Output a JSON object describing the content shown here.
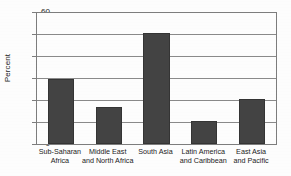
{
  "chart_data": {
    "type": "bar",
    "title": "",
    "xlabel": "",
    "ylabel": "Percent",
    "ylim": [
      0,
      60
    ],
    "ytick_values": [
      0,
      10,
      20,
      30,
      40,
      50,
      60
    ],
    "ytick_labels": [
      "0",
      "10",
      "20",
      "30",
      "40",
      "50",
      "60"
    ],
    "grid": true,
    "legend": "none",
    "categories": [
      "Sub-Saharan\nAfrica",
      "Middle East\nand North Africa",
      "South Asia",
      "Latin America\nand Caribbean",
      "East Asia\nand Pacific"
    ],
    "values": [
      30,
      17,
      51,
      10.5,
      20.5
    ],
    "bar_color": "#434343",
    "plot_border_color": "#7d7d7d",
    "gridline_color": "#8a8a8a",
    "background_color": "#fdfdfd"
  },
  "axes": {
    "y": {
      "title": "Percent",
      "ticks": [
        {
          "label": "60",
          "value": 60
        },
        {
          "label": "50",
          "value": 50
        },
        {
          "label": "40",
          "value": 40
        },
        {
          "label": "30",
          "value": 30
        },
        {
          "label": "20",
          "value": 20
        },
        {
          "label": "10",
          "value": 10
        },
        {
          "label": "0",
          "value": 0
        }
      ]
    },
    "x": {
      "categories": [
        {
          "line1": "Sub-Saharan",
          "line2": "Africa"
        },
        {
          "line1": "Middle East",
          "line2": "and North Africa"
        },
        {
          "line1": "South Asia",
          "line2": ""
        },
        {
          "line1": "Latin America",
          "line2": "and Caribbean"
        },
        {
          "line1": "East Asia",
          "line2": "and Pacific"
        }
      ]
    }
  },
  "title_sliver": {
    "text": ""
  }
}
